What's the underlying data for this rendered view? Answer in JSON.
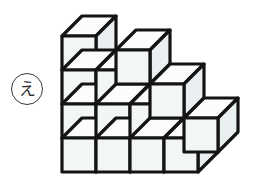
{
  "figure": {
    "type": "isometric-cube-stack-illustration",
    "label": {
      "text": "え",
      "shape": "circle",
      "name": "option-label-e"
    },
    "background_color": "#ffffff",
    "stroke_color": "#141414",
    "face_front_color": "#f2f6f7",
    "face_top_color": "#fbfdfd",
    "face_side_color": "#eaeff1",
    "stroke_width": 3.2,
    "cube_count": 13,
    "geometry": {
      "unit": 34,
      "depth_dx": 20,
      "depth_dy": -20,
      "origin_x": 62,
      "origin_y": 172
    },
    "cubes": [
      {
        "name": "cube-r0-c0-d0",
        "col": 0,
        "row": 0,
        "depth": 0
      },
      {
        "name": "cube-r0-c1-d0",
        "col": 1,
        "row": 0,
        "depth": 0
      },
      {
        "name": "cube-r0-c2-d0",
        "col": 2,
        "row": 0,
        "depth": 0
      },
      {
        "name": "cube-r0-c3-d0",
        "col": 3,
        "row": 0,
        "depth": 0
      },
      {
        "name": "cube-r1-c0-d0",
        "col": 0,
        "row": 1,
        "depth": 0
      },
      {
        "name": "cube-r1-c1-d0",
        "col": 1,
        "row": 1,
        "depth": 0
      },
      {
        "name": "cube-r1-c2-d0",
        "col": 2,
        "row": 1,
        "depth": 0
      },
      {
        "name": "cube-r2-c0-d0",
        "col": 0,
        "row": 2,
        "depth": 0
      },
      {
        "name": "cube-r2-c1-d0",
        "col": 1,
        "row": 2,
        "depth": 0
      },
      {
        "name": "cube-r3-c0-d0",
        "col": 0,
        "row": 3,
        "depth": 0
      },
      {
        "name": "cube-r0-c4-d1",
        "col": 3,
        "row": 0,
        "depth": 1
      },
      {
        "name": "cube-r1-c3-d1",
        "col": 2,
        "row": 1,
        "depth": 1
      },
      {
        "name": "cube-r2-c2-d1",
        "col": 1,
        "row": 2,
        "depth": 1
      }
    ]
  }
}
